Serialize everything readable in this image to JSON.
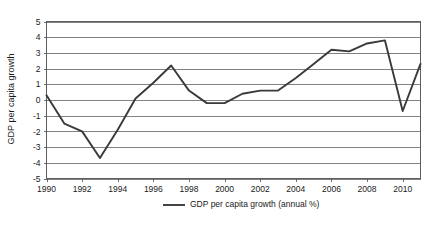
{
  "chart_data": {
    "type": "line",
    "title": "",
    "xlabel": "",
    "ylabel": "GDP per capita growth",
    "ylim": [
      -5,
      5
    ],
    "xlim": [
      1990,
      2011
    ],
    "grid": true,
    "legend_position": "bottom",
    "y_ticks": [
      "5",
      "4",
      "3",
      "2",
      "1",
      "0",
      "-1",
      "-2",
      "-3",
      "-4",
      "-5"
    ],
    "y_tick_values": [
      5,
      4,
      3,
      2,
      1,
      0,
      -1,
      -2,
      -3,
      -4,
      -5
    ],
    "x_ticks": [
      "1990",
      "1992",
      "1994",
      "1996",
      "1998",
      "2000",
      "2002",
      "2004",
      "2006",
      "2008",
      "2010"
    ],
    "x_tick_values": [
      1990,
      1992,
      1994,
      1996,
      1998,
      2000,
      2002,
      2004,
      2006,
      2008,
      2010
    ],
    "x": [
      1990,
      1991,
      1992,
      1993,
      1994,
      1995,
      1996,
      1997,
      1998,
      1999,
      2000,
      2001,
      2002,
      2003,
      2004,
      2005,
      2006,
      2007,
      2008,
      2009,
      2010,
      2011
    ],
    "series": [
      {
        "name": "GDP per capita growth (annual %)",
        "values": [
          0.3,
          -1.5,
          -2.0,
          -3.7,
          -1.9,
          0.1,
          1.1,
          2.2,
          0.6,
          -0.2,
          -0.2,
          0.4,
          0.6,
          0.6,
          1.4,
          2.3,
          3.2,
          3.1,
          3.6,
          3.8,
          -0.7,
          2.3
        ]
      }
    ],
    "legend": [
      {
        "label": "GDP per capita growth (annual %)",
        "color": "#3a3a3a"
      }
    ]
  },
  "caption": {
    "text": ""
  },
  "colors": {
    "series_line": "#3a3a3a",
    "gridline": "#4d4d4d",
    "frame": "#4d4d4d",
    "text": "#1a1a1a",
    "background": "#ffffff"
  }
}
